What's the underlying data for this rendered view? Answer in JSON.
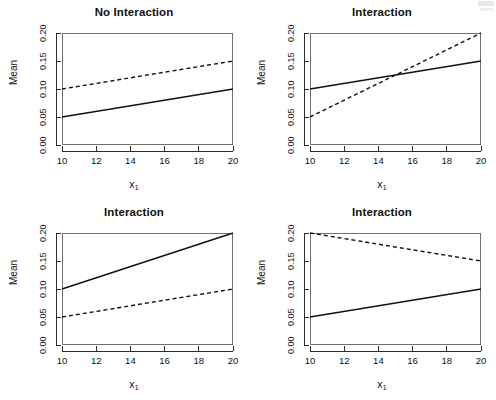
{
  "figure": {
    "layout": "2x2",
    "background": "#ffffff",
    "line_color": "#111111"
  },
  "axis": {
    "ylabel": "Mean",
    "xlabel_base": "x",
    "xlabel_sub": "1",
    "yticks": [
      "0.00",
      "0.05",
      "0.10",
      "0.15",
      "0.20"
    ],
    "xticks": [
      "10",
      "12",
      "14",
      "16",
      "18",
      "20"
    ]
  },
  "chart_data": [
    {
      "type": "line",
      "title": "No Interaction",
      "xlabel": "x_1",
      "ylabel": "Mean",
      "xlim": [
        10,
        20
      ],
      "ylim": [
        0.0,
        0.2
      ],
      "xticks": [
        10,
        12,
        14,
        16,
        18,
        20
      ],
      "yticks": [
        0.0,
        0.05,
        0.1,
        0.15,
        0.2
      ],
      "grid": false,
      "legend": "none",
      "series": [
        {
          "name": "solid",
          "style": "solid",
          "x": [
            10,
            20
          ],
          "values": [
            0.05,
            0.1
          ]
        },
        {
          "name": "dashed",
          "style": "dashed",
          "x": [
            10,
            20
          ],
          "values": [
            0.1,
            0.15
          ]
        }
      ]
    },
    {
      "type": "line",
      "title": "Interaction",
      "xlabel": "x_1",
      "ylabel": "Mean",
      "xlim": [
        10,
        20
      ],
      "ylim": [
        0.0,
        0.2
      ],
      "xticks": [
        10,
        12,
        14,
        16,
        18,
        20
      ],
      "yticks": [
        0.0,
        0.05,
        0.1,
        0.15,
        0.2
      ],
      "grid": false,
      "legend": "none",
      "series": [
        {
          "name": "solid",
          "style": "solid",
          "x": [
            10,
            20
          ],
          "values": [
            0.1,
            0.15
          ]
        },
        {
          "name": "dashed",
          "style": "dashed",
          "x": [
            10,
            20
          ],
          "values": [
            0.05,
            0.2
          ]
        }
      ]
    },
    {
      "type": "line",
      "title": "Interaction",
      "xlabel": "x_1",
      "ylabel": "Mean",
      "xlim": [
        10,
        20
      ],
      "ylim": [
        0.0,
        0.2
      ],
      "xticks": [
        10,
        12,
        14,
        16,
        18,
        20
      ],
      "yticks": [
        0.0,
        0.05,
        0.1,
        0.15,
        0.2
      ],
      "grid": false,
      "legend": "none",
      "series": [
        {
          "name": "solid",
          "style": "solid",
          "x": [
            10,
            20
          ],
          "values": [
            0.1,
            0.2
          ]
        },
        {
          "name": "dashed",
          "style": "dashed",
          "x": [
            10,
            20
          ],
          "values": [
            0.05,
            0.1
          ]
        }
      ]
    },
    {
      "type": "line",
      "title": "Interaction",
      "xlabel": "x_1",
      "ylabel": "Mean",
      "xlim": [
        10,
        20
      ],
      "ylim": [
        0.0,
        0.2
      ],
      "xticks": [
        10,
        12,
        14,
        16,
        18,
        20
      ],
      "yticks": [
        0.0,
        0.05,
        0.1,
        0.15,
        0.2
      ],
      "grid": false,
      "legend": "none",
      "series": [
        {
          "name": "solid",
          "style": "solid",
          "x": [
            10,
            20
          ],
          "values": [
            0.05,
            0.1
          ]
        },
        {
          "name": "dashed",
          "style": "dashed",
          "x": [
            10,
            20
          ],
          "values": [
            0.2,
            0.15
          ]
        }
      ]
    }
  ]
}
